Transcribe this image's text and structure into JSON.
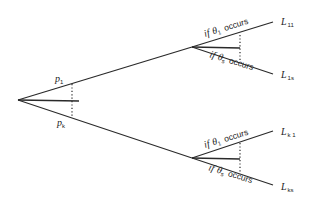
{
  "diagram": {
    "type": "decision-tree",
    "root": {
      "branches": [
        {
          "prob_symbol": "p",
          "prob_sub": "1"
        },
        {
          "prob_symbol": "p",
          "prob_sub": "k"
        }
      ]
    },
    "nodes": [
      {
        "id": "upper",
        "outcomes": [
          {
            "cond_prefix": "if",
            "theta": "θ",
            "theta_sub": "1",
            "cond_suffix": "occurs",
            "leaf_symbol": "L",
            "leaf_sub": "11"
          },
          {
            "cond_prefix": "if",
            "theta": "θ",
            "theta_sub": "s",
            "cond_suffix": "occurs",
            "leaf_symbol": "L",
            "leaf_sub": "1s"
          }
        ]
      },
      {
        "id": "lower",
        "outcomes": [
          {
            "cond_prefix": "if",
            "theta": "θ",
            "theta_sub": "1",
            "cond_suffix": "occurs",
            "leaf_symbol": "L",
            "leaf_sub": "k 1"
          },
          {
            "cond_prefix": "if",
            "theta": "θ",
            "theta_sub": "s",
            "cond_suffix": "occurs",
            "leaf_symbol": "L",
            "leaf_sub": "ks"
          }
        ]
      }
    ]
  }
}
